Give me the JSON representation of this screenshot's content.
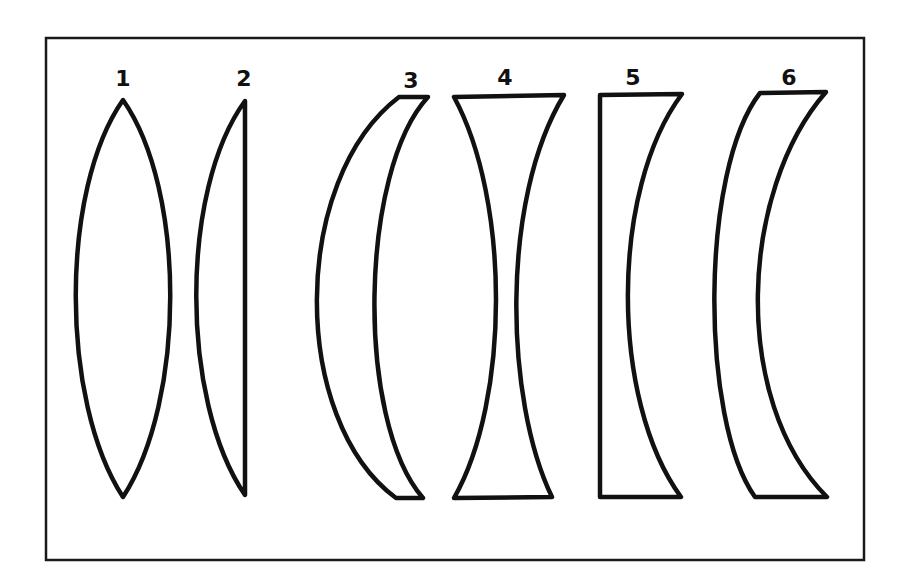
{
  "diagram": {
    "title": "",
    "background": "#ffffff",
    "stroke_color": "#111111",
    "lenses": [
      {
        "label": "1",
        "shape": "biconvex"
      },
      {
        "label": "2",
        "shape": "plano-convex"
      },
      {
        "label": "3",
        "shape": "positive-meniscus"
      },
      {
        "label": "4",
        "shape": "biconcave"
      },
      {
        "label": "5",
        "shape": "plano-concave"
      },
      {
        "label": "6",
        "shape": "negative-meniscus"
      }
    ]
  }
}
